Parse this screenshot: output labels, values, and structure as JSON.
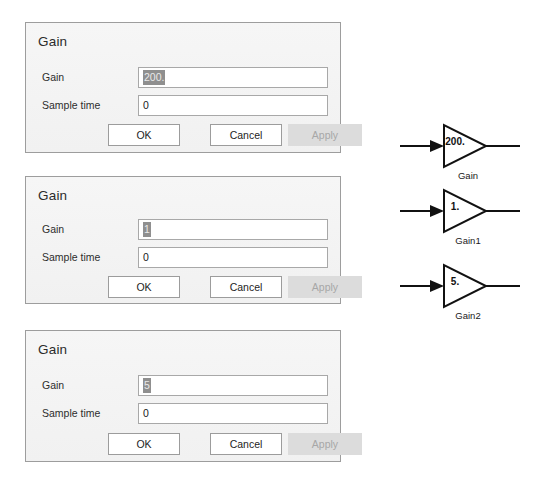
{
  "window": {
    "background_color": "#ffffff",
    "width": 536,
    "height": 485
  },
  "dialogs": [
    {
      "title": "Gain",
      "fields": [
        {
          "label": "Gain",
          "value": "200.",
          "selected": true
        },
        {
          "label": "Sample time",
          "value": "0",
          "selected": false
        }
      ],
      "buttons": [
        {
          "label": "OK",
          "enabled": true
        },
        {
          "label": "Cancel",
          "enabled": true
        },
        {
          "label": "Apply",
          "enabled": false
        }
      ]
    },
    {
      "title": "Gain",
      "fields": [
        {
          "label": "Gain",
          "value": "1",
          "selected": true
        },
        {
          "label": "Sample time",
          "value": "0",
          "selected": false
        }
      ],
      "buttons": [
        {
          "label": "OK",
          "enabled": true
        },
        {
          "label": "Cancel",
          "enabled": true
        },
        {
          "label": "Apply",
          "enabled": false
        }
      ]
    },
    {
      "title": "Gain",
      "fields": [
        {
          "label": "Gain",
          "value": "5",
          "selected": true
        },
        {
          "label": "Sample time",
          "value": "0",
          "selected": false
        }
      ],
      "buttons": [
        {
          "label": "OK",
          "enabled": true
        },
        {
          "label": "Cancel",
          "enabled": true
        },
        {
          "label": "Apply",
          "enabled": false
        }
      ]
    }
  ],
  "diagram": {
    "blocks": [
      {
        "name": "Gain",
        "gain_value": "200.",
        "icon": "triangle-gain-block-icon"
      },
      {
        "name": "Gain1",
        "gain_value": "1.",
        "icon": "triangle-gain-block-icon"
      },
      {
        "name": "Gain2",
        "gain_value": "5.",
        "icon": "triangle-gain-block-icon"
      }
    ],
    "line_color": "#111111"
  },
  "colors": {
    "dialog_background": "#f3f3f3",
    "dialog_border": "#9d9d9d",
    "input_background": "#ffffff",
    "input_border": "#a8a8a8",
    "selection_highlight": "#8f8f8f",
    "button_background": "#ffffff",
    "button_disabled_background": "#dcdcdc",
    "button_disabled_text": "#a7a7a7",
    "text": "#1d1d1d"
  }
}
